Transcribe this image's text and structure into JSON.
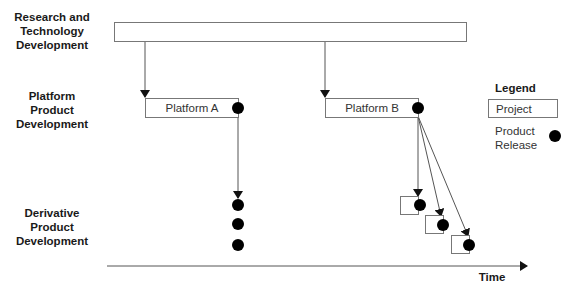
{
  "rows": {
    "research": "Research and Technology Development",
    "research_lines": [
      "Research and",
      "Technology",
      "Development"
    ],
    "platform_lines": [
      "Platform",
      "Product",
      "Development"
    ],
    "derivative_lines": [
      "Derivative",
      "Product",
      "Development"
    ]
  },
  "projects": {
    "platform_a": "Platform A",
    "platform_b": "Platform B"
  },
  "legend": {
    "title": "Legend",
    "project_label": "Project",
    "release_label_lines": [
      "Product",
      "Release"
    ]
  },
  "axis": {
    "label": "Time"
  }
}
